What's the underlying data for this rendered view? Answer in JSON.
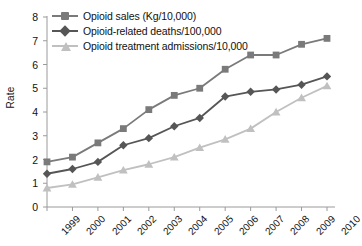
{
  "chart_data": {
    "type": "line",
    "title": "",
    "xlabel": "",
    "ylabel": "Rate",
    "x": [
      "1999",
      "2000",
      "2001",
      "2002",
      "2003",
      "2004",
      "2005",
      "2006",
      "2007",
      "2008",
      "2009",
      "2010"
    ],
    "categories": [
      "1999",
      "2000",
      "2001",
      "2002",
      "2003",
      "2004",
      "2005",
      "2006",
      "2007",
      "2008",
      "2009",
      "2010"
    ],
    "ylim": [
      0,
      8
    ],
    "yticks": [
      "0",
      "1",
      "2",
      "3",
      "4",
      "5",
      "6",
      "7",
      "8"
    ],
    "grid": false,
    "legend_position": "top-left",
    "series": [
      {
        "name": "Opioid sales (Kg/10,000)",
        "color": "#7a7a7a",
        "marker": "square",
        "values": [
          1.9,
          2.1,
          2.7,
          3.3,
          4.1,
          4.7,
          5.0,
          5.8,
          6.4,
          6.4,
          6.85,
          7.1
        ]
      },
      {
        "name": "Opioid-related deaths/100,000",
        "color": "#565656",
        "marker": "diamond",
        "values": [
          1.4,
          1.6,
          1.9,
          2.6,
          2.9,
          3.4,
          3.75,
          4.65,
          4.85,
          4.95,
          5.15,
          5.5
        ]
      },
      {
        "name": "Opioid treatment admissions/10,000",
        "color": "#c0c0c0",
        "marker": "triangle",
        "values": [
          0.8,
          0.95,
          1.25,
          1.55,
          1.8,
          2.1,
          2.5,
          2.85,
          3.3,
          4.0,
          4.6,
          5.1
        ]
      }
    ]
  },
  "axis": {
    "label_y": "Rate"
  },
  "legend": {
    "items": [
      {
        "label": "Opioid sales (Kg/10,000)"
      },
      {
        "label": "Opioid-related deaths/100,000"
      },
      {
        "label": "Opioid treatment admissions/10,000"
      }
    ]
  }
}
